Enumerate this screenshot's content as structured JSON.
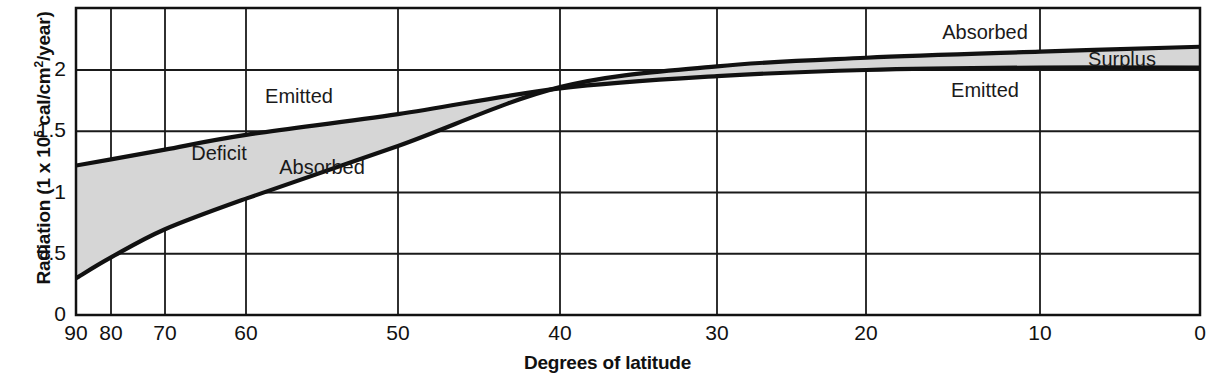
{
  "chart_data": {
    "type": "area",
    "title": "",
    "subtitle": "",
    "xlabel": "Degrees of latitude",
    "ylabel_text": "Radiation (1 x 10",
    "ylabel_sup1": "5",
    "ylabel_mid": " cal/cm",
    "ylabel_sup2": "2",
    "ylabel_end": "/year)",
    "ylabel_full": "Radiation (1 x 105 cal/cm2/year)",
    "x": [
      90,
      80,
      70,
      60,
      50,
      40,
      30,
      20,
      10,
      0
    ],
    "x_pixels": [
      76,
      111,
      165,
      246,
      398,
      560,
      717,
      866,
      1040,
      1200
    ],
    "xticks": [
      "90",
      "80",
      "70",
      "60",
      "50",
      "40",
      "30",
      "20",
      "10",
      "0"
    ],
    "yticks": [
      "0",
      "0.5",
      "1",
      "1.5",
      "2"
    ],
    "ytick_values": [
      0,
      0.5,
      1,
      1.5,
      2
    ],
    "xlim": [
      90,
      0
    ],
    "ylim": [
      0,
      2.4
    ],
    "grid": true,
    "legend": "inline-annotations",
    "series": [
      {
        "name": "Emitted",
        "values": [
          1.22,
          1.27,
          1.35,
          1.47,
          1.64,
          1.85,
          1.95,
          2.0,
          2.02,
          2.02
        ]
      },
      {
        "name": "Absorbed",
        "values": [
          0.3,
          0.47,
          0.7,
          0.95,
          1.38,
          1.86,
          2.03,
          2.1,
          2.15,
          2.19
        ]
      }
    ],
    "regions": [
      {
        "name": "Deficit",
        "from_latitude": 90,
        "to_latitude": 40,
        "fill": "#d6d6d6"
      },
      {
        "name": "Surplus",
        "from_latitude": 40,
        "to_latitude": 0,
        "fill": "#d6d6d6"
      }
    ],
    "annotations": [
      {
        "text": "Emitted",
        "x": 299,
        "y": 103,
        "series": "Emitted",
        "side": "above-left"
      },
      {
        "text": "Deficit",
        "x": 219,
        "y": 160,
        "series": "region"
      },
      {
        "text": "Absorbed",
        "x": 322,
        "y": 174,
        "series": "Absorbed",
        "side": "below-left"
      },
      {
        "text": "Absorbed",
        "x": 985,
        "y": 39,
        "series": "Absorbed",
        "side": "above-right"
      },
      {
        "text": "Surplus",
        "x": 1122,
        "y": 66,
        "series": "region"
      },
      {
        "text": "Emitted",
        "x": 985,
        "y": 97,
        "series": "Emitted",
        "side": "below-right"
      }
    ],
    "colors": {
      "line": "#111111",
      "fill": "#d6d6d6",
      "grid": "#1a1a1a",
      "axis": "#111111",
      "text": "#111111",
      "background": "#ffffff"
    }
  }
}
